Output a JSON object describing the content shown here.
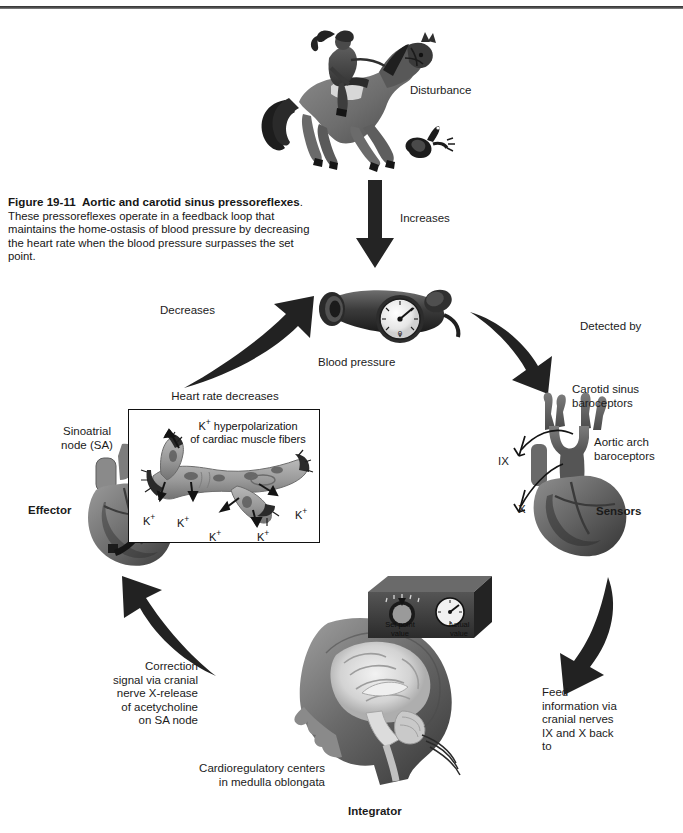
{
  "figure": {
    "number": "Figure 19-11",
    "title": "Aortic and carotid sinus pressoreflexes",
    "caption_rest": ". These pressoreflexes operate in a feedback loop that maintains the home-ostasis of blood pressure by decreasing the heart rate when the blood pressure surpasses the set point."
  },
  "nodes": {
    "disturbance": "Disturbance",
    "blood_pressure": "Blood pressure",
    "carotid_sinus": "Carotid sinus\nbaroceptors",
    "aortic_arch": "Aortic arch\nbaroceptors",
    "sensors": "Sensors",
    "integrator": "Integrator",
    "cardioregulatory": "Cardioregulatory centers\nin medulla oblongata",
    "effector": "Effector",
    "sinoatrial": "Sinoatrial\nnode (SA)",
    "heart_rate_decreases": "Heart rate decreases",
    "k_hyperpolarization": "hyperpolarization\nof cardiac muscle fibers"
  },
  "arrow_labels": {
    "increases": "Increases",
    "detected_by": "Detected by",
    "feed_information": "Feed\ninformation via\ncranial nerves\nIX and X back\nto",
    "correction_signal": "Correction\nsignal via cranial\nnerve X-release\nof acetycholine\non SA node",
    "decreases": "Decreases"
  },
  "nerves": {
    "glossopharyngeal": "IX",
    "vagus": "X"
  },
  "control_box": {
    "set_point": "Set point\nvalue",
    "actual": "Actual\nvalue"
  },
  "ions": {
    "symbol": "K",
    "charge": "+",
    "labels": [
      "K",
      "K",
      "K",
      "K",
      "K"
    ]
  },
  "colors": {
    "ink": "#151515",
    "art_dark": "#3b3b3b",
    "art_mid": "#6f6f6f",
    "art_light": "#a8a8a8",
    "paper": "#ffffff"
  }
}
